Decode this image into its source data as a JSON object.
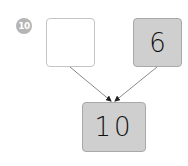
{
  "problem": {
    "number": "10"
  },
  "boxes": {
    "left_part": {
      "value": "",
      "state": "empty"
    },
    "right_part": {
      "value": "6",
      "state": "filled"
    },
    "whole": {
      "value": "10",
      "state": "filled"
    }
  },
  "colors": {
    "badge": "#b5b5b5",
    "filled_box": "#cfcfcf",
    "empty_box": "#ffffff",
    "border": "#a9a9a9",
    "arrow": "#7a7a7a"
  }
}
